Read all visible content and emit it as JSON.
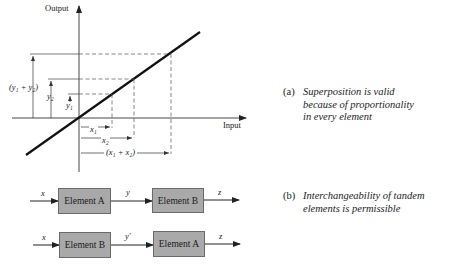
{
  "graph": {
    "y_axis_label": "Output",
    "x_axis_label": "Input",
    "y_labels": {
      "y1": "y₁",
      "y2": "y₂",
      "y1_plus_y2": "(y₁ + y₂)"
    },
    "x_labels": {
      "x1": "x₁",
      "x2": "x₂",
      "x1_plus_x2": "(x₁ + x₂)"
    }
  },
  "captions": {
    "a": {
      "tag": "(a)",
      "lines": [
        "Superposition is valid",
        "because of proportionality",
        "in every element"
      ]
    },
    "b": {
      "tag": "(b)",
      "lines": [
        "Interchangeability of tandem",
        "elements is permissible"
      ]
    }
  },
  "block_diagrams": {
    "row1": {
      "input": "x",
      "block1": "Element A",
      "middle": "y",
      "block2": "Element B",
      "output": "z"
    },
    "row2": {
      "input": "x",
      "block1": "Element B",
      "middle": "y′",
      "block2": "Element A",
      "output": "z"
    }
  },
  "colors": {
    "line": "#111111",
    "block_fill": "#a9a9a9",
    "block_border": "#6a6a6a",
    "dashed": "#555555"
  }
}
